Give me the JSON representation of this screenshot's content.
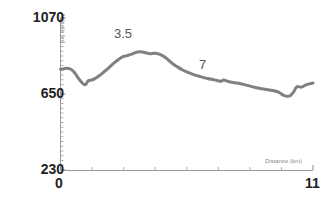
{
  "chart_data": {
    "type": "line",
    "title": "",
    "subtitle": "",
    "xlabel": "Distance (km)",
    "ylabel": "Altitude [m]",
    "xlim": [
      0,
      11
    ],
    "ylim": [
      230,
      1070
    ],
    "yticks": [
      230,
      650,
      1070
    ],
    "ytick_labels": [
      "230",
      "650",
      "1070"
    ],
    "xticks": [
      0,
      11
    ],
    "xtick_labels": [
      "0",
      "11"
    ],
    "xminorticks": [
      1.375,
      2.75,
      4.125,
      5.5,
      6.875,
      8.25,
      9.625
    ],
    "grid": false,
    "legend": null,
    "line_color": "#808080",
    "line_width": 3,
    "series": [
      {
        "name": "Elevation profile",
        "x": [
          0.0,
          0.15,
          0.3,
          0.45,
          0.6,
          0.75,
          0.9,
          1.0,
          1.1,
          1.2,
          1.35,
          1.5,
          1.7,
          1.9,
          2.1,
          2.3,
          2.5,
          2.7,
          2.9,
          3.1,
          3.3,
          3.5,
          3.7,
          3.9,
          4.1,
          4.3,
          4.5,
          4.7,
          4.9,
          5.1,
          5.3,
          5.5,
          5.8,
          6.1,
          6.4,
          6.7,
          6.9,
          7.0,
          7.1,
          7.25,
          7.4,
          7.6,
          7.8,
          8.0,
          8.3,
          8.6,
          8.9,
          9.1,
          9.3,
          9.5,
          9.7,
          9.85,
          10.0,
          10.15,
          10.3,
          10.5,
          10.7,
          10.85,
          11.0
        ],
        "y": [
          787,
          790,
          792,
          787,
          770,
          742,
          718,
          705,
          702,
          722,
          727,
          735,
          752,
          773,
          795,
          818,
          838,
          855,
          862,
          870,
          881,
          884,
          878,
          873,
          875,
          870,
          858,
          838,
          816,
          800,
          784,
          772,
          757,
          746,
          736,
          728,
          722,
          720,
          727,
          722,
          716,
          712,
          708,
          702,
          692,
          683,
          676,
          672,
          668,
          660,
          644,
          638,
          640,
          660,
          690,
          688,
          700,
          706,
          710
        ]
      }
    ],
    "annotations": [
      {
        "text": "3.5",
        "x": 3.5,
        "y": 884
      },
      {
        "text": "7",
        "x": 7.0,
        "y": 720
      }
    ]
  },
  "axes": {
    "y_title": "Altitude [m]",
    "x_title": "Distance (km)",
    "y_tick_top": "1070",
    "y_tick_mid": "650",
    "y_tick_bottom": "230",
    "x_tick_start": "0",
    "x_tick_end": "11"
  },
  "colors": {
    "line": "#808080",
    "axis": "#9a9a9a",
    "tick_label": "#222222",
    "annotation": "#555555",
    "axis_title": "#8a8a8a",
    "background": "#ffffff"
  }
}
